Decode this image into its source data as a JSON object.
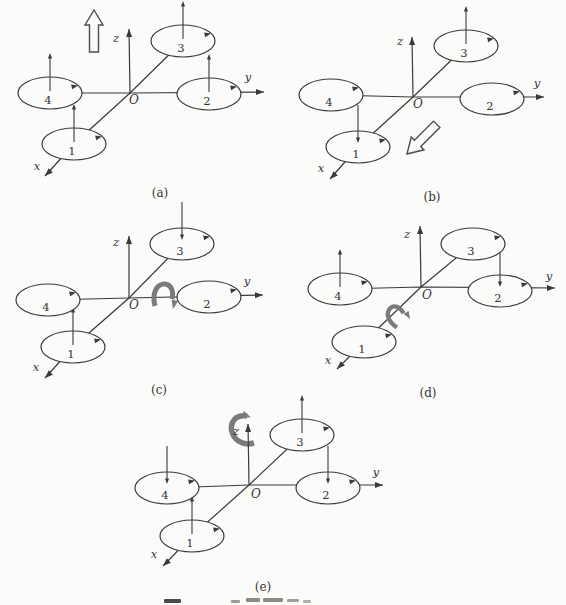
{
  "colors": {
    "background": "#fbfbf9",
    "line": "#3a3a3a",
    "text": "#333333",
    "gray_arrow": "#7b7b7b",
    "hollow_stroke": "#4d4d4d"
  },
  "axis_labels": {
    "x": "x",
    "y": "y",
    "z": "z",
    "origin": "O"
  },
  "panels": [
    {
      "id": "a",
      "caption": "(a)",
      "caption_pos": [
        160,
        197
      ],
      "origin": [
        130,
        93
      ],
      "z_tip": [
        129,
        29
      ],
      "z_label": [
        116,
        42
      ],
      "y_tip": [
        264,
        92
      ],
      "y_label": [
        248,
        81
      ],
      "x_tip": [
        45,
        176
      ],
      "x_label": [
        37,
        170
      ],
      "o_label": [
        134,
        104
      ],
      "rotors": [
        {
          "label": "1",
          "c": [
            74,
            144
          ],
          "thrust": "up"
        },
        {
          "label": "2",
          "c": [
            209,
            94
          ],
          "thrust": "up"
        },
        {
          "label": "3",
          "c": [
            183,
            41
          ],
          "thrust": "up"
        },
        {
          "label": "4",
          "c": [
            50,
            93
          ],
          "thrust": "up"
        }
      ],
      "motion": {
        "type": "hollow-up",
        "name": "ascend-direction",
        "x": 94,
        "y": 10
      }
    },
    {
      "id": "b",
      "caption": "(b)",
      "caption_pos": [
        432,
        201
      ],
      "origin": [
        413,
        97
      ],
      "z_tip": [
        412,
        37
      ],
      "z_label": [
        400,
        45
      ],
      "y_tip": [
        544,
        97
      ],
      "y_label": [
        537,
        87
      ],
      "x_tip": [
        330,
        179
      ],
      "x_label": [
        321,
        172
      ],
      "o_label": [
        418,
        108
      ],
      "rotors": [
        {
          "label": "1",
          "c": [
            358,
            147
          ],
          "thrust": "down"
        },
        {
          "label": "2",
          "c": [
            492,
            99
          ],
          "thrust": "none"
        },
        {
          "label": "3",
          "c": [
            466,
            46
          ],
          "thrust": "up"
        },
        {
          "label": "4",
          "c": [
            331,
            95
          ],
          "thrust": "none"
        }
      ],
      "motion": {
        "type": "hollow-diag",
        "name": "forward-translation",
        "x": 407,
        "y": 154,
        "angle": 225
      }
    },
    {
      "id": "c",
      "caption": "(c)",
      "caption_pos": [
        159,
        394
      ],
      "origin": [
        129,
        298
      ],
      "z_tip": [
        129,
        236
      ],
      "z_label": [
        116,
        246
      ],
      "y_tip": [
        263,
        295
      ],
      "y_label": [
        247,
        285
      ],
      "x_tip": [
        45,
        378
      ],
      "x_label": [
        36,
        371
      ],
      "o_label": [
        134,
        309
      ],
      "rotors": [
        {
          "label": "1",
          "c": [
            73,
            347
          ],
          "thrust": "up"
        },
        {
          "label": "2",
          "c": [
            209,
            297
          ],
          "thrust": "none"
        },
        {
          "label": "3",
          "c": [
            182,
            244
          ],
          "thrust": "down"
        },
        {
          "label": "4",
          "c": [
            48,
            300
          ],
          "thrust": "none"
        }
      ],
      "motion": {
        "type": "arch",
        "name": "pitch-rotation",
        "x": 163,
        "y": 292
      }
    },
    {
      "id": "d",
      "caption": "(d)",
      "caption_pos": [
        428,
        397
      ],
      "origin": [
        421,
        287
      ],
      "z_tip": [
        420,
        226
      ],
      "z_label": [
        407,
        238
      ],
      "y_tip": [
        555,
        288
      ],
      "y_label": [
        549,
        280
      ],
      "x_tip": [
        337,
        369
      ],
      "x_label": [
        328,
        364
      ],
      "o_label": [
        427,
        299
      ],
      "rotors": [
        {
          "label": "1",
          "c": [
            364,
            342
          ],
          "thrust": "none"
        },
        {
          "label": "2",
          "c": [
            500,
            291
          ],
          "thrust": "down"
        },
        {
          "label": "3",
          "c": [
            473,
            244
          ],
          "thrust": "none"
        },
        {
          "label": "4",
          "c": [
            340,
            289
          ],
          "thrust": "up"
        }
      ],
      "motion": {
        "type": "arch",
        "name": "roll-rotation",
        "x": 394,
        "y": 314,
        "angle": -42
      }
    },
    {
      "id": "e",
      "caption": "(e)",
      "caption_pos": [
        263,
        591
      ],
      "origin": [
        249,
        485
      ],
      "z_tip": [
        248,
        424
      ],
      "z_label": [
        236,
        435
      ],
      "y_tip": [
        383,
        485
      ],
      "y_label": [
        376,
        476
      ],
      "x_tip": [
        163,
        566
      ],
      "x_label": [
        154,
        558
      ],
      "o_label": [
        256,
        498
      ],
      "rotors": [
        {
          "label": "1",
          "c": [
            192,
            536
          ],
          "thrust": "up"
        },
        {
          "label": "2",
          "c": [
            328,
            488
          ],
          "thrust": "down"
        },
        {
          "label": "3",
          "c": [
            302,
            435
          ],
          "thrust": "up"
        },
        {
          "label": "4",
          "c": [
            167,
            488
          ],
          "thrust": "down"
        }
      ],
      "motion": {
        "type": "yaw-c",
        "name": "yaw-rotation",
        "x": 242,
        "y": 429,
        "behind": true
      }
    }
  ],
  "artifacts": [
    {
      "x": 164,
      "y": 599,
      "w": 17,
      "h": 4,
      "c": "#4a4a4a"
    },
    {
      "x": 231,
      "y": 600,
      "w": 9,
      "h": 3,
      "c": "#9a9a96"
    },
    {
      "x": 246,
      "y": 598,
      "w": 14,
      "h": 4,
      "c": "#8b8b87"
    },
    {
      "x": 263,
      "y": 598,
      "w": 20,
      "h": 4,
      "c": "#8b8b87"
    },
    {
      "x": 287,
      "y": 599,
      "w": 12,
      "h": 3,
      "c": "#a0a09c"
    },
    {
      "x": 303,
      "y": 600,
      "w": 8,
      "h": 3,
      "c": "#b0b0ac"
    }
  ]
}
